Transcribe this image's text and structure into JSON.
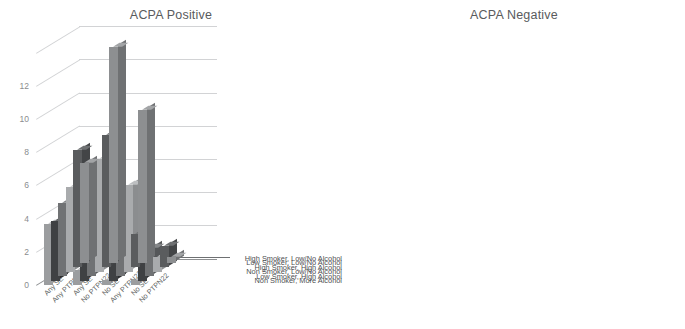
{
  "figure": {
    "width": 685,
    "height": 329,
    "background": "#ffffff"
  },
  "palette": {
    "series_face": [
      "#8d8f91",
      "#5a5c5e",
      "#a9abad",
      "#707274",
      "#3f4143",
      "#9b9d9f"
    ],
    "series_side": [
      "#6f7173",
      "#434547",
      "#8b8d8f",
      "#555759",
      "#2c2e30",
      "#7d7f81"
    ],
    "series_top": [
      "#a2a4a6",
      "#6e7072",
      "#bdbfc1",
      "#858789",
      "#535557",
      "#b0b2b4"
    ],
    "grid": "#d2d3d5",
    "axis": "#8e9092",
    "text": "#58595b",
    "title": "#595b5d"
  },
  "axis": {
    "y_ticks": [
      0,
      2,
      4,
      6,
      8,
      10,
      12
    ],
    "y_min": 0,
    "y_max": 14,
    "grid": true
  },
  "categories": [
    {
      "line1": "Any SE",
      "line2": "Any PTPN22"
    },
    {
      "line1": "Any SE",
      "line2": "No PTPN22"
    },
    {
      "line1": "No SE",
      "line2": "Any PTPN22"
    },
    {
      "line1": "No SE",
      "line2": "No PTPN22"
    }
  ],
  "series_labels": [
    "High Smoker, Low/No Alcohol",
    "Low Smoker, Low/No Alcohol",
    "High Smoker, High Alcohol",
    "Non Smoker, Low/No Alcohol",
    "Low Smoker, High Alcohol",
    "Non Smoker, More Alcohol"
  ],
  "chart_data": [
    {
      "type": "bar",
      "subtype": "3d-grouped-bar",
      "title": "ACPA Positive",
      "xlabel": "",
      "ylabel": "",
      "categories": [
        "Any SE / Any PTPN22",
        "Any SE / No PTPN22",
        "No SE / Any PTPN22",
        "No SE / No PTPN22"
      ],
      "ylim": [
        0,
        14
      ],
      "yticks": [
        0,
        2,
        4,
        6,
        8,
        10,
        12
      ],
      "grid": true,
      "legend_position": "right-depth-axis",
      "series": [
        {
          "name": "High Smoker, Low/No Alcohol",
          "values": [
            6.0,
            13.0,
            9.2,
            0.35
          ]
        },
        {
          "name": "Low Smoker, Low/No Alcohol",
          "values": [
            7.1,
            8.0,
            2.0,
            1.3
          ]
        },
        {
          "name": "High Smoker, High Alcohol",
          "values": [
            5.1,
            6.8,
            5.2,
            0.9
          ]
        },
        {
          "name": "Non Smoker, Low/No Alcohol",
          "values": [
            4.4,
            3.3,
            1.5,
            1.7
          ]
        },
        {
          "name": "Low Smoker, High Alcohol",
          "values": [
            3.6,
            2.3,
            1.2,
            1.1
          ]
        },
        {
          "name": "Non Smoker, More Alcohol",
          "values": [
            3.7,
            0.9,
            0.3,
            0.3
          ]
        }
      ]
    },
    {
      "type": "bar",
      "subtype": "3d-grouped-bar",
      "title": "ACPA Negative",
      "xlabel": "",
      "ylabel": "",
      "categories": [
        "Any SE / Any PTPN22",
        "Any SE / No PTPN22",
        "No SE / Any PTPN22",
        "No SE / No PTPN22"
      ],
      "ylim": [
        0,
        14
      ],
      "yticks": [
        0,
        2,
        4,
        6,
        8,
        10,
        12
      ],
      "grid": true,
      "legend_position": "right-depth-axis",
      "series": [
        {
          "name": "High Smoker, Low/No Alcohol",
          "values": [
            0.4,
            3.9,
            1.6,
            1.6
          ]
        },
        {
          "name": "Low Smoker, Low/No Alcohol",
          "values": [
            1.4,
            1.5,
            2.3,
            1.4
          ]
        },
        {
          "name": "High Smoker, High Alcohol",
          "values": [
            1.2,
            1.3,
            1.5,
            1.5
          ]
        },
        {
          "name": "Non Smoker, Low/No Alcohol",
          "values": [
            1.1,
            1.2,
            1.2,
            1.3
          ]
        },
        {
          "name": "Low Smoker, High Alcohol",
          "values": [
            1.0,
            1.1,
            1.0,
            1.1
          ]
        },
        {
          "name": "Non Smoker, More Alcohol",
          "values": [
            0.9,
            0.8,
            0.4,
            0.8
          ]
        }
      ]
    }
  ]
}
